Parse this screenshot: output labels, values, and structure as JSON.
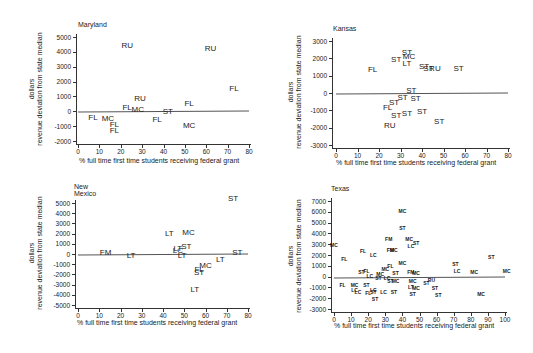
{
  "chart_data": [
    {
      "type": "scatter",
      "title": "Maryland",
      "xlabel": "% full time first time students receiving federal grant",
      "ylabel": "dollars\nrevenue deviation from state median",
      "xlim": [
        0,
        80
      ],
      "ylim": [
        -2000,
        5000
      ],
      "xticks": [
        0,
        10,
        20,
        30,
        40,
        50,
        60,
        70,
        80
      ],
      "yticks": [
        5000,
        4000,
        3000,
        2000,
        1000,
        0,
        -1000,
        -2000
      ],
      "reference_line": 0,
      "points": [
        {
          "label": "RU",
          "x": 23,
          "y": 4400
        },
        {
          "label": "RU",
          "x": 62,
          "y": 4200
        },
        {
          "label": "FL",
          "x": 73,
          "y": 1500
        },
        {
          "label": "RU",
          "x": 29,
          "y": 800
        },
        {
          "label": "FL",
          "x": 52,
          "y": 500
        },
        {
          "label": "FL",
          "x": 23,
          "y": 200
        },
        {
          "label": "MC",
          "x": 28,
          "y": 100
        },
        {
          "label": "ST",
          "x": 42,
          "y": -50
        },
        {
          "label": "FL",
          "x": 7,
          "y": -450
        },
        {
          "label": "MC",
          "x": 14,
          "y": -500
        },
        {
          "label": "FL",
          "x": 37,
          "y": -600
        },
        {
          "label": "FL",
          "x": 17,
          "y": -900
        },
        {
          "label": "FL",
          "x": 17,
          "y": -1300
        },
        {
          "label": "MC",
          "x": 52,
          "y": -1000
        }
      ]
    },
    {
      "type": "scatter",
      "title": "Kansas",
      "xlabel": "% full time first time students receiving federal grant",
      "ylabel": "dollars\nrevenue deviation from state median",
      "xlim": [
        0,
        80
      ],
      "ylim": [
        -3000,
        3000
      ],
      "xticks": [
        0,
        10,
        20,
        30,
        40,
        50,
        60,
        70,
        80
      ],
      "yticks": [
        3000,
        2000,
        1000,
        0,
        -1000,
        -2000,
        -3000
      ],
      "reference_line": 0,
      "points": [
        {
          "label": "ST",
          "x": 33,
          "y": 2300
        },
        {
          "label": "MC",
          "x": 34,
          "y": 2100
        },
        {
          "label": "ST",
          "x": 28,
          "y": 1900
        },
        {
          "label": "LT",
          "x": 33,
          "y": 1700
        },
        {
          "label": "FL",
          "x": 17,
          "y": 1300
        },
        {
          "label": "ST",
          "x": 41,
          "y": 1500
        },
        {
          "label": "ST",
          "x": 43,
          "y": 1400
        },
        {
          "label": "RU",
          "x": 46,
          "y": 1400
        },
        {
          "label": "ST",
          "x": 57,
          "y": 1400
        },
        {
          "label": "ST",
          "x": 35,
          "y": 100
        },
        {
          "label": "ST",
          "x": 31,
          "y": -300
        },
        {
          "label": "ST",
          "x": 37,
          "y": -350
        },
        {
          "label": "ST",
          "x": 27,
          "y": -550
        },
        {
          "label": "FL",
          "x": 24,
          "y": -850
        },
        {
          "label": "ST",
          "x": 28,
          "y": -1300
        },
        {
          "label": "ST",
          "x": 33,
          "y": -1200
        },
        {
          "label": "ST",
          "x": 40,
          "y": -1100
        },
        {
          "label": "ST",
          "x": 48,
          "y": -1700
        },
        {
          "label": "RU",
          "x": 25,
          "y": -1900
        }
      ]
    },
    {
      "type": "scatter",
      "title": "New Mexico",
      "xlabel": "% full time first time students receiving federal grant",
      "ylabel": "dollars\nrevenue deviation from state median",
      "xlim": [
        0,
        80
      ],
      "ylim": [
        -5000,
        5000
      ],
      "xticks": [
        0,
        10,
        20,
        30,
        40,
        50,
        60,
        70,
        80
      ],
      "yticks": [
        5000,
        4000,
        3000,
        2000,
        1000,
        0,
        -1000,
        -2000,
        -3000,
        -4000,
        -5000
      ],
      "reference_line": 0,
      "points": [
        {
          "label": "ST",
          "x": 73,
          "y": 5400
        },
        {
          "label": "LT",
          "x": 43,
          "y": 2000
        },
        {
          "label": "MC",
          "x": 52,
          "y": 2100
        },
        {
          "label": "LT",
          "x": 47,
          "y": 500
        },
        {
          "label": "ST",
          "x": 51,
          "y": 700
        },
        {
          "label": "LC",
          "x": 47,
          "y": 300
        },
        {
          "label": "FM",
          "x": 13,
          "y": 100
        },
        {
          "label": "LT",
          "x": 25,
          "y": -200
        },
        {
          "label": "LT",
          "x": 49,
          "y": -200
        },
        {
          "label": "ST",
          "x": 75,
          "y": 100
        },
        {
          "label": "LT",
          "x": 67,
          "y": -600
        },
        {
          "label": "MC",
          "x": 60,
          "y": -1200
        },
        {
          "label": "FL",
          "x": 57,
          "y": -1600
        },
        {
          "label": "ST",
          "x": 57,
          "y": -1900
        },
        {
          "label": "LT",
          "x": 55,
          "y": -3500
        }
      ]
    },
    {
      "type": "scatter",
      "title": "Texas",
      "xlabel": "% full time first time students receiving federal grant",
      "ylabel": "dollars\nrevenue deviation from state median",
      "xlim": [
        0,
        100
      ],
      "ylim": [
        -3000,
        7000
      ],
      "xticks": [
        0,
        10,
        20,
        30,
        40,
        50,
        60,
        70,
        80,
        90,
        100
      ],
      "yticks": [
        7000,
        6000,
        5000,
        4000,
        3000,
        2000,
        1000,
        0,
        -1000,
        -2000,
        -3000
      ],
      "reference_line": 0,
      "points": [
        {
          "label": "MC",
          "x": 40,
          "y": 6100
        },
        {
          "label": "ST",
          "x": 40,
          "y": 4500
        },
        {
          "label": "FM",
          "x": 32,
          "y": 3500
        },
        {
          "label": "MC",
          "x": 44,
          "y": 3500
        },
        {
          "label": "ST",
          "x": 48,
          "y": 3100
        },
        {
          "label": "LC",
          "x": 45,
          "y": 2800
        },
        {
          "label": "MC",
          "x": 0,
          "y": 2900
        },
        {
          "label": "FM",
          "x": 33,
          "y": 2500
        },
        {
          "label": "MC",
          "x": 35,
          "y": 2500
        },
        {
          "label": "FL",
          "x": 17,
          "y": 2400
        },
        {
          "label": "LC",
          "x": 23,
          "y": 2000
        },
        {
          "label": "FL",
          "x": 6,
          "y": 1600
        },
        {
          "label": "ST",
          "x": 92,
          "y": 1800
        },
        {
          "label": "MC",
          "x": 40,
          "y": 1300
        },
        {
          "label": "ST",
          "x": 71,
          "y": 1200
        },
        {
          "label": "FL",
          "x": 33,
          "y": 1000
        },
        {
          "label": "MC",
          "x": 30,
          "y": 700
        },
        {
          "label": "FL",
          "x": 19,
          "y": 500
        },
        {
          "label": "ST",
          "x": 16,
          "y": 400
        },
        {
          "label": "LC",
          "x": 72,
          "y": 500
        },
        {
          "label": "MC",
          "x": 82,
          "y": 400
        },
        {
          "label": "MC",
          "x": 101,
          "y": 500
        },
        {
          "label": "FM",
          "x": 45,
          "y": 400
        },
        {
          "label": "MC",
          "x": 48,
          "y": 300
        },
        {
          "label": "ST",
          "x": 36,
          "y": 300
        },
        {
          "label": "MC",
          "x": 27,
          "y": 200
        },
        {
          "label": "LC",
          "x": 21,
          "y": 100
        },
        {
          "label": "ST",
          "x": 26,
          "y": -100
        },
        {
          "label": "LC",
          "x": 31,
          "y": -100
        },
        {
          "label": "ST",
          "x": 33,
          "y": -400
        },
        {
          "label": "MC",
          "x": 36,
          "y": -400
        },
        {
          "label": "MC",
          "x": 46,
          "y": -400
        },
        {
          "label": "RU",
          "x": 57,
          "y": -300
        },
        {
          "label": "ST",
          "x": 54,
          "y": -600
        },
        {
          "label": "FL",
          "x": 5,
          "y": -800
        },
        {
          "label": "MC",
          "x": 12,
          "y": -800
        },
        {
          "label": "ST",
          "x": 19,
          "y": -800
        },
        {
          "label": "LC",
          "x": 12,
          "y": -1200
        },
        {
          "label": "LC",
          "x": 14,
          "y": -1400
        },
        {
          "label": "LT",
          "x": 45,
          "y": -1000
        },
        {
          "label": "MC",
          "x": 48,
          "y": -1100
        },
        {
          "label": "ST",
          "x": 59,
          "y": -1100
        },
        {
          "label": "LC",
          "x": 23,
          "y": -1200
        },
        {
          "label": "FL",
          "x": 20,
          "y": -1500
        },
        {
          "label": "ST",
          "x": 23,
          "y": -1400
        },
        {
          "label": "LC",
          "x": 29,
          "y": -1400
        },
        {
          "label": "ST",
          "x": 35,
          "y": -1400
        },
        {
          "label": "ST",
          "x": 46,
          "y": -1600
        },
        {
          "label": "ST",
          "x": 61,
          "y": -1700
        },
        {
          "label": "MC",
          "x": 86,
          "y": -1600
        },
        {
          "label": "ST",
          "x": 24,
          "y": -2100
        }
      ]
    }
  ],
  "panels": [
    {
      "title": "Maryland",
      "ylabel_line1": "dollars",
      "ylabel_line2": "revenue deviation from state median",
      "xlabel": "% full time first time students receiving federal grant"
    },
    {
      "title": "Kansas",
      "ylabel_line1": "dollars",
      "ylabel_line2": "revenue deviation from state median",
      "xlabel": "% full time first time students receiving federal grant"
    },
    {
      "title": "New Mexico",
      "ylabel_line1": "dollars",
      "ylabel_line2": "revenue deviation from state median",
      "xlabel": "% full time first time students receiving federal grant"
    },
    {
      "title": "Texas",
      "ylabel_line1": "dollars",
      "ylabel_line2": "revenue deviation from state median",
      "xlabel": "% full time first time students receiving federal grant"
    }
  ]
}
